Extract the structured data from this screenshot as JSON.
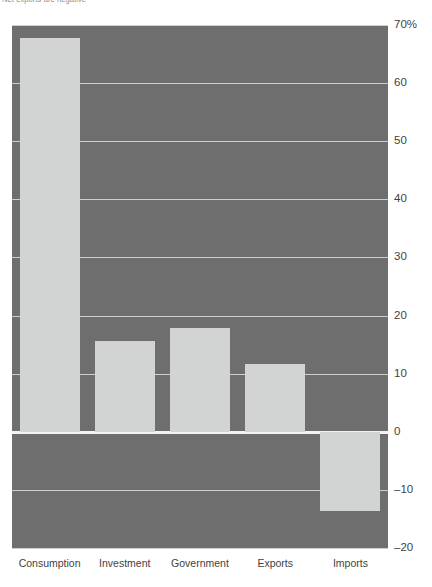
{
  "caption": {
    "text": "Net exports are negative"
  },
  "chart_data": {
    "type": "bar",
    "title": "",
    "xlabel": "",
    "ylabel": "",
    "categories": [
      "Consumption",
      "Investment",
      "Government",
      "Exports",
      "Imports"
    ],
    "values": [
      67.8,
      15.7,
      17.9,
      11.7,
      -13.7
    ],
    "ylim": [
      -20,
      70
    ],
    "yticks": [
      70,
      60,
      50,
      40,
      30,
      20,
      10,
      0,
      -10,
      -20
    ],
    "ytick_labels": [
      "70%",
      "60",
      "50",
      "40",
      "30",
      "20",
      "10",
      "0",
      "-10",
      "-20"
    ],
    "grid": true,
    "legend": "none",
    "colors": {
      "plot_background": "#6e6e6e",
      "bar_fill": "#d2d4d3",
      "gridline": "#cfcfcf",
      "zero_line": "#f3f3f3",
      "text": "#3f3f3f",
      "page_background": "#ffffff"
    }
  }
}
